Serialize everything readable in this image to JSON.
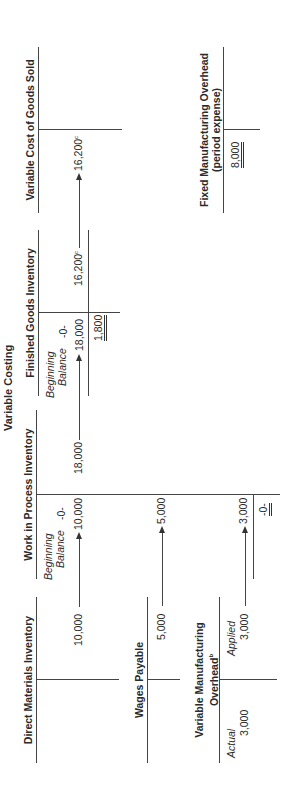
{
  "title": "Variable Costing",
  "accounts": {
    "direct_materials": {
      "title": "Direct Materials Inventory",
      "credit": "10,000"
    },
    "work_in_process": {
      "title": "Work in Process Inventory",
      "beginning_label_1": "Beginning",
      "beginning_label_2": "Balance",
      "beginning_value": "-0-",
      "debit_materials": "10,000",
      "debit_labor": "5,000",
      "debit_overhead": "3,000",
      "ending_balance": "-0-",
      "credit": "18,000"
    },
    "finished_goods": {
      "title": "Finished Goods Inventory",
      "beginning_label_1": "Beginning",
      "beginning_label_2": "Balance",
      "beginning_value": "-0-",
      "debit": "18,000",
      "ending_balance": "1,800",
      "credit": "16,200",
      "credit_note": "c"
    },
    "variable_cogs": {
      "title": "Variable Cost of Goods Sold",
      "debit": "16,200",
      "debit_note": "c"
    },
    "wages_payable": {
      "title": "Wages Payable",
      "credit": "5,000"
    },
    "variable_overhead": {
      "title_1": "Variable Manufacturing",
      "title_2": "Overhead",
      "title_note": "b",
      "actual_label": "Actual",
      "actual_value": "3,000",
      "applied_label": "Applied",
      "applied_value": "3,000"
    },
    "fixed_overhead": {
      "title_1": "Fixed Manufacturing Overhead",
      "title_2": "(period expense)",
      "debit": "8,000"
    }
  }
}
